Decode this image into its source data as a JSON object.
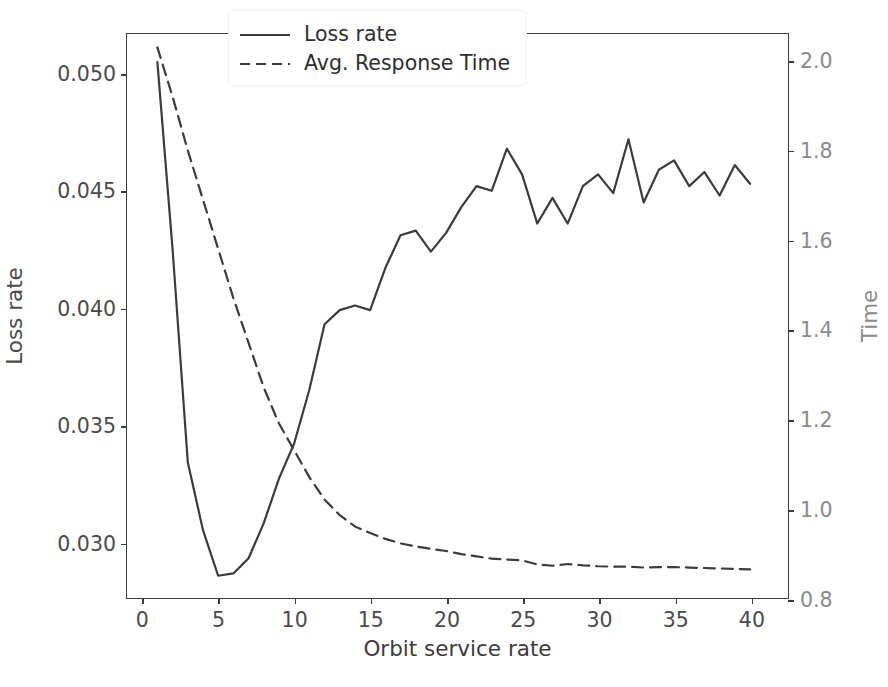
{
  "chart_data": {
    "type": "line",
    "title": "",
    "xlabel": "Orbit service rate",
    "ylabel": "Loss rate",
    "y2label": "Time",
    "xlim": [
      -1.0,
      42.5
    ],
    "ylim": [
      0.0276,
      0.0517
    ],
    "y2lim": [
      0.8,
      2.06
    ],
    "xticks": [
      0,
      5,
      10,
      15,
      20,
      25,
      30,
      35,
      40
    ],
    "xticklabels": [
      "0",
      "5",
      "10",
      "15",
      "20",
      "25",
      "30",
      "35",
      "40"
    ],
    "yticks": [
      0.03,
      0.035,
      0.04,
      0.045,
      0.05
    ],
    "yticklabels": [
      "0.030",
      "0.035",
      "0.040",
      "0.045",
      "0.050"
    ],
    "y2ticks": [
      0.8,
      1.0,
      1.2,
      1.4,
      1.6,
      1.8,
      2.0
    ],
    "y2ticklabels": [
      "0.8",
      "1.0",
      "1.2",
      "1.4",
      "1.6",
      "1.8",
      "2.0"
    ],
    "grid": false,
    "legend_position": "upper center",
    "x": [
      1,
      2,
      3,
      4,
      5,
      6,
      7,
      8,
      9,
      10,
      11,
      12,
      13,
      14,
      15,
      16,
      17,
      18,
      19,
      20,
      21,
      22,
      23,
      24,
      25,
      26,
      27,
      28,
      29,
      30,
      31,
      32,
      33,
      34,
      35,
      36,
      37,
      38,
      39,
      40
    ],
    "series": [
      {
        "name": "Loss rate",
        "axis": "left",
        "linestyle": "solid",
        "color": "#3b3b3b",
        "values": [
          0.0505,
          0.0425,
          0.0334,
          0.0305,
          0.02855,
          0.02865,
          0.0293,
          0.0308,
          0.0327,
          0.0342,
          0.0365,
          0.0393,
          0.0399,
          0.0401,
          0.0399,
          0.0417,
          0.0431,
          0.0433,
          0.0424,
          0.0432,
          0.0443,
          0.0452,
          0.045,
          0.0468,
          0.0457,
          0.0436,
          0.0447,
          0.0436,
          0.0452,
          0.0457,
          0.0449,
          0.0472,
          0.0445,
          0.0459,
          0.0463,
          0.0452,
          0.0458,
          0.0448,
          0.0461,
          0.0453
        ]
      },
      {
        "name": "Avg. Response Time",
        "axis": "right",
        "linestyle": "dashed",
        "color": "#3b3b3b",
        "values": [
          2.03,
          1.92,
          1.8,
          1.69,
          1.58,
          1.47,
          1.37,
          1.27,
          1.19,
          1.13,
          1.07,
          1.02,
          0.985,
          0.96,
          0.945,
          0.932,
          0.922,
          0.915,
          0.91,
          0.905,
          0.898,
          0.893,
          0.888,
          0.886,
          0.884,
          0.875,
          0.872,
          0.876,
          0.873,
          0.871,
          0.87,
          0.87,
          0.868,
          0.869,
          0.869,
          0.868,
          0.867,
          0.866,
          0.865,
          0.864
        ]
      }
    ],
    "legend": [
      {
        "label": "Loss rate",
        "linestyle": "solid"
      },
      {
        "label": "Avg. Response Time",
        "linestyle": "dashed"
      }
    ]
  }
}
